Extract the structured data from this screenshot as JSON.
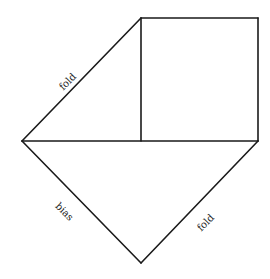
{
  "diagram": {
    "type": "geometric-folding-diagram",
    "stroke_color": "#1a1a1a",
    "vertices": {
      "square_top_left": [
        141,
        18
      ],
      "square_top_right": [
        258,
        18
      ],
      "square_bottom_right": [
        258,
        141
      ],
      "square_bottom_left": [
        141,
        141
      ],
      "left_point": [
        22,
        141
      ],
      "bottom_point": [
        141,
        263
      ]
    },
    "labels": [
      {
        "id": "upper-left-fold",
        "text": "fold",
        "x": 70,
        "y": 84,
        "rotate": -45
      },
      {
        "id": "lower-left-bias",
        "text": "bias",
        "x": 62,
        "y": 214,
        "rotate": 45
      },
      {
        "id": "lower-right-fold",
        "text": "fold",
        "x": 208,
        "y": 225,
        "rotate": -45
      }
    ]
  }
}
